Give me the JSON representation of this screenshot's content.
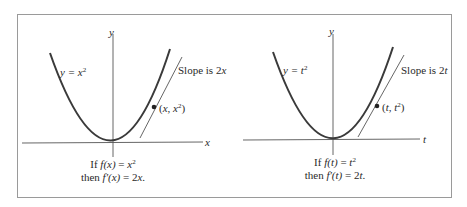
{
  "panels": [
    {
      "var": "x",
      "axis_y_label": "y",
      "axis_x_label": "x",
      "curve_label_prefix": "y = ",
      "curve_label_var": "x",
      "curve_label_exp": "2",
      "slope_label_prefix": "Slope is 2",
      "slope_label_var": "x",
      "point_label_open": "(",
      "point_label_var1": "x",
      "point_label_sep": ", ",
      "point_label_var2": "x",
      "point_label_exp": "2",
      "point_label_close": ")",
      "caption_line1_prefix": "If ",
      "caption_line1_func": "f(x)",
      "caption_line1_eq": " = ",
      "caption_line1_var": "x",
      "caption_line1_exp": "2",
      "caption_line2_prefix": "then ",
      "caption_line2_func": "f′(x)",
      "caption_line2_eq": " = 2",
      "caption_line2_var": "x",
      "caption_line2_end": "."
    },
    {
      "var": "t",
      "axis_y_label": "y",
      "axis_x_label": "t",
      "curve_label_prefix": "y = ",
      "curve_label_var": "t",
      "curve_label_exp": "2",
      "slope_label_prefix": "Slope is 2",
      "slope_label_var": "t",
      "point_label_open": "(",
      "point_label_var1": "t",
      "point_label_sep": ", ",
      "point_label_var2": "t",
      "point_label_exp": "2",
      "point_label_close": ")",
      "caption_line1_prefix": "If ",
      "caption_line1_func": "f(t)",
      "caption_line1_eq": " = ",
      "caption_line1_var": "t",
      "caption_line1_exp": "2",
      "caption_line2_prefix": "then ",
      "caption_line2_func": "f′(t)",
      "caption_line2_eq": " = 2",
      "caption_line2_var": "t",
      "caption_line2_end": "."
    }
  ],
  "colors": {
    "curve": "#3a3a3a",
    "axis": "#555555",
    "frame": "#9a9a9a"
  }
}
